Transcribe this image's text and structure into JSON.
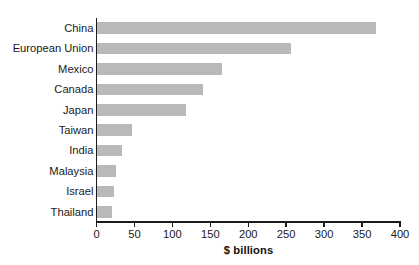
{
  "chart_data": {
    "type": "bar",
    "orientation": "horizontal",
    "title": "",
    "subtitle": "",
    "xlabel": "$ billions",
    "ylabel": "",
    "categories": [
      "China",
      "European Union",
      "Mexico",
      "Canada",
      "Japan",
      "Taiwan",
      "India",
      "Malaysia",
      "Israel",
      "Thailand"
    ],
    "values": [
      368,
      256,
      166,
      140,
      118,
      47,
      34,
      26,
      23,
      20
    ],
    "xlim": [
      0,
      400
    ],
    "xticks": [
      0,
      50,
      100,
      150,
      200,
      250,
      300,
      350,
      400
    ],
    "xtick_labels": [
      "0",
      "50",
      "100",
      "150",
      "200",
      "250",
      "300",
      "350",
      "400"
    ],
    "grid": false,
    "legend": false,
    "bar_color": "#b9b9b9",
    "axis_color": "#1c1c1c",
    "text_color": "#1a1a1a",
    "background_color": "#ffffff"
  }
}
